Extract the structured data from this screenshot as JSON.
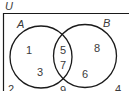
{
  "universe_label": "U",
  "sets": [
    {
      "label": "A"
    },
    {
      "label": "B"
    }
  ],
  "regions": {
    "a_only": [
      "1",
      "3"
    ],
    "a_and_b": [
      "5",
      "7"
    ],
    "b_only": [
      "8",
      "6"
    ],
    "outside": [
      "2",
      "9",
      "4"
    ]
  },
  "colors": {
    "line": "#1a1a1a",
    "text": "#3a3a3a",
    "background": "#ffffff"
  }
}
